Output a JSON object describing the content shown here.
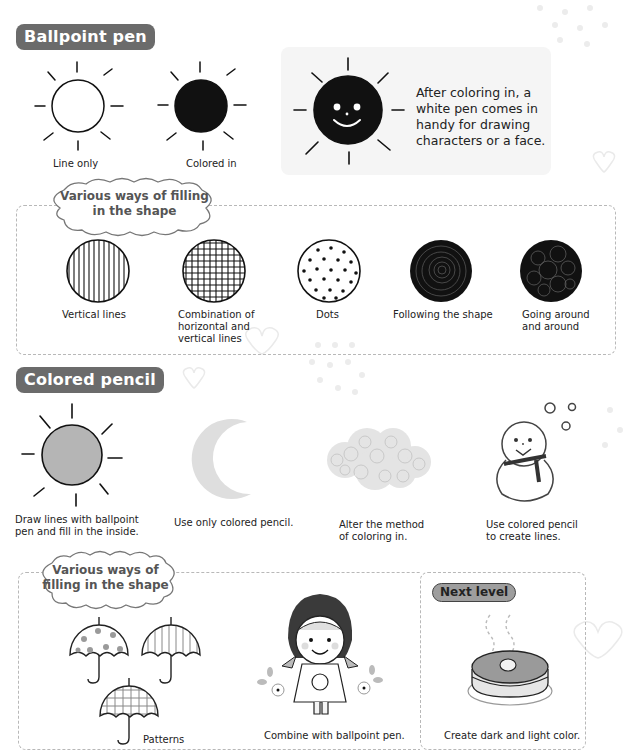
{
  "sections": {
    "ballpoint": {
      "label": "Ballpoint pen",
      "examples": [
        {
          "caption": "Line only",
          "icon": "sun-outline-icon"
        },
        {
          "caption": "Colored in",
          "icon": "sun-filled-icon"
        }
      ],
      "note": {
        "lines": [
          "After coloring in, a",
          "white pen comes in",
          "handy for drawing",
          "characters or a face."
        ],
        "icon": "sun-smiley-icon"
      },
      "fill_ways": {
        "title_lines": [
          "Various ways of filling",
          "in the shape"
        ],
        "items": [
          {
            "caption_lines": [
              "Vertical lines"
            ],
            "icon": "vertical-lines-circle-icon"
          },
          {
            "caption_lines": [
              "Combination of",
              "horizontal and",
              "vertical lines"
            ],
            "icon": "grid-circle-icon"
          },
          {
            "caption_lines": [
              "Dots"
            ],
            "icon": "dots-circle-icon"
          },
          {
            "caption_lines": [
              "Following the shape"
            ],
            "icon": "spiral-circle-icon"
          },
          {
            "caption_lines": [
              "Going around",
              "and around"
            ],
            "icon": "scribble-circle-icon"
          }
        ]
      }
    },
    "colored_pencil": {
      "label": "Colored pencil",
      "examples": [
        {
          "caption_lines": [
            "Draw lines with ballpoint",
            "pen and fill in the inside."
          ],
          "icon": "sun-gray-icon"
        },
        {
          "caption_lines": [
            "Use only colored pencil."
          ],
          "icon": "crescent-moon-icon"
        },
        {
          "caption_lines": [
            "Alter the method",
            "of coloring in."
          ],
          "icon": "cloud-scribble-icon"
        },
        {
          "caption_lines": [
            "Use colored pencil",
            "to create lines."
          ],
          "icon": "snowman-icon"
        }
      ],
      "fill_ways": {
        "title_lines": [
          "Various ways of",
          "filling in the shape"
        ],
        "patterns_caption": "Patterns",
        "combine_caption": "Combine with ballpoint pen.",
        "next_level": {
          "label": "Next level",
          "caption": "Create dark and light color."
        }
      }
    }
  },
  "colors": {
    "label_bg": "#6b6b6b",
    "ink": "#111111",
    "pencil_gray": "#b5b5b5",
    "dash": "#b8b8b8",
    "note_bg": "#f5f5f5",
    "pill_bg": "#9e9e9e"
  }
}
